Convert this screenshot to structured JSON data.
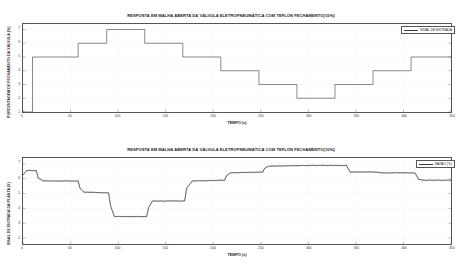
{
  "figure": {
    "panels": [
      {
        "id": "top",
        "title": "RESPOSTA EM MALHA ABERTA DA VÁLVULA ELETROPNEUMÁTICA COM TEFLON FECHAMENTO[10%]",
        "xlabel": "TEMPO (s)",
        "ylabel": "PORCENTAGEM DE FECHAMENTO DA VÁLVULA (%)",
        "legend": "SINAL DE ENTRADA"
      },
      {
        "id": "bottom",
        "title": "RESPOSTA EM MALHA ABERTA DA VÁLVULA ELETROPNEUMÁTICA COM TEFLON FECHAMENTO[10%]",
        "xlabel": "TEMPO (s)",
        "ylabel": "SINAL DE ENTRADA DA PLANTA (V)",
        "legend": "VAZÃO (%)"
      }
    ]
  },
  "chart_data": [
    {
      "type": "line",
      "id": "top-step-input",
      "title": "RESPOSTA EM MALHA ABERTA DA VÁLVULA ELETROPNEUMÁTICA COM TEFLON FECHAMENTO[10%]",
      "xlabel": "TEMPO (s)",
      "ylabel": "PORCENTAGEM DE FECHAMENTO DA VÁLVULA (%)",
      "grid": true,
      "legend_position": "upper right",
      "series": [
        {
          "name": "SINAL DE ENTRADA",
          "color": "#3a3a3a",
          "x": [
            0,
            10,
            10,
            58,
            58,
            88,
            88,
            128,
            128,
            168,
            168,
            208,
            208,
            248,
            248,
            288,
            288,
            328,
            328,
            368,
            368,
            408,
            408,
            450
          ],
          "values": [
            1,
            1,
            5,
            5,
            6,
            6,
            7,
            7,
            6,
            6,
            5,
            5,
            4,
            4,
            3,
            3,
            2,
            2,
            3,
            3,
            4,
            4,
            5,
            5
          ]
        }
      ],
      "xlim": [
        0,
        450
      ],
      "ylim": [
        1,
        7.4
      ],
      "xticks": [
        0,
        50,
        100,
        150,
        200,
        250,
        300,
        350,
        400,
        450
      ],
      "xticklabels": [
        "0",
        "50",
        "100",
        "150",
        "200",
        "250",
        "300",
        "350",
        "400",
        "450"
      ],
      "yticks": [
        1,
        2,
        3,
        4,
        5,
        6,
        7
      ],
      "yticklabels": [
        "1",
        "2",
        "3",
        "4",
        "5",
        "6",
        "7"
      ]
    },
    {
      "type": "line",
      "id": "bottom-plant-response",
      "title": "RESPOSTA EM MALHA ABERTA DA VÁLVULA ELETROPNEUMÁTICA COM TEFLON FECHAMENTO[10%]",
      "xlabel": "TEMPO (s)",
      "ylabel": "SINAL DE ENTRADA DA PLANTA (V)",
      "grid": true,
      "legend_position": "upper right",
      "series": [
        {
          "name": "VAZÃO (%)",
          "color": "#3a3a3a",
          "x": [
            0,
            4,
            14,
            16,
            22,
            58,
            60,
            64,
            90,
            92,
            96,
            130,
            132,
            136,
            170,
            172,
            178,
            212,
            214,
            218,
            252,
            254,
            258,
            300,
            340,
            344,
            372,
            376,
            412,
            416,
            420,
            450
          ],
          "values": [
            6.25,
            6.55,
            6.55,
            6.05,
            5.85,
            5.85,
            5.35,
            5.1,
            5.05,
            4.2,
            3.45,
            3.45,
            4.05,
            4.5,
            4.5,
            5.35,
            5.85,
            5.9,
            6.2,
            6.4,
            6.45,
            6.7,
            6.85,
            6.9,
            6.9,
            6.45,
            6.45,
            6.4,
            6.4,
            5.95,
            5.9,
            5.9
          ]
        }
      ],
      "xlim": [
        0,
        450
      ],
      "ylim": [
        1.6,
        7.4
      ],
      "xticks": [
        0,
        50,
        100,
        150,
        200,
        250,
        300,
        350,
        400,
        450
      ],
      "xticklabels": [
        "0",
        "50",
        "100",
        "150",
        "200",
        "250",
        "300",
        "350",
        "400",
        "450"
      ],
      "yticks": [
        2,
        3,
        4,
        5,
        6,
        7
      ],
      "yticklabels": [
        "2",
        "3",
        "4",
        "5",
        "6",
        "7"
      ]
    }
  ]
}
